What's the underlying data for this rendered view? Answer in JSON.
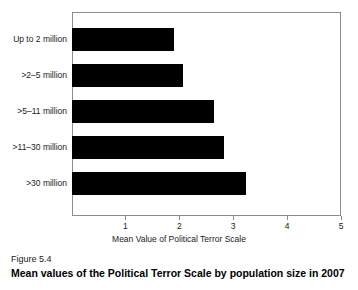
{
  "chart_data": {
    "type": "bar",
    "orientation": "horizontal",
    "title": "",
    "xlabel": "Mean Value of Political Terror Scale",
    "ylabel": "",
    "categories": [
      "Up to 2 million",
      ">2–5 million",
      ">5–11 million",
      ">11–30 million",
      ">30 million"
    ],
    "values": [
      1.91,
      2.06,
      2.64,
      2.83,
      3.24
    ],
    "xlim": [
      0,
      5
    ],
    "xticks": [
      1,
      2,
      3,
      4,
      5
    ],
    "xtick_labels": [
      "1",
      "2",
      "3",
      "4",
      "5"
    ],
    "grid": false,
    "legend": false,
    "bar_color": "#000000",
    "frame_color": "#8c8c8c"
  },
  "caption": {
    "figure_number": "Figure 5.4",
    "title": "Mean values of the Political Terror Scale by population size in 2007"
  }
}
